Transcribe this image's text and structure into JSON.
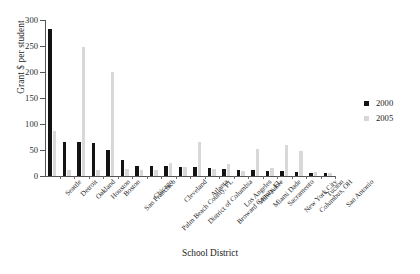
{
  "chart_data": {
    "type": "bar",
    "title": "",
    "xlabel": "School District",
    "ylabel": "Grant $ per student",
    "ylim": [
      0,
      300
    ],
    "yticks": [
      0,
      50,
      100,
      150,
      200,
      250,
      300
    ],
    "grid": false,
    "legend_position": "right",
    "categories": [
      "Seattle",
      "Detroit",
      "Oakland",
      "Houston",
      "Boston",
      "San Francisco",
      "Chicago",
      "Palm Beach County, FL",
      "Cleveland",
      "District of Columbia",
      "Atlanta",
      "Broward County, FL",
      "Los Angeles",
      "Milwaukee",
      "Miami Dade",
      "Sacramento",
      "New York City",
      "Columbus, OH",
      "Tucson",
      "San Antonio"
    ],
    "series": [
      {
        "name": "2000",
        "color": "#131313",
        "values": [
          282,
          66,
          65,
          64,
          50,
          30,
          20,
          20,
          19,
          18,
          17,
          16,
          13,
          12,
          11,
          10,
          9,
          7,
          6,
          5
        ]
      },
      {
        "name": "2005",
        "color": "#d8d8d8",
        "values": [
          87,
          12,
          248,
          11,
          200,
          13,
          12,
          11,
          25,
          18,
          66,
          13,
          24,
          10,
          52,
          16,
          60,
          48,
          7,
          6
        ]
      }
    ]
  },
  "legend": {
    "items": [
      {
        "label": "2000",
        "color": "#131313"
      },
      {
        "label": "2005",
        "color": "#d8d8d8"
      }
    ]
  }
}
